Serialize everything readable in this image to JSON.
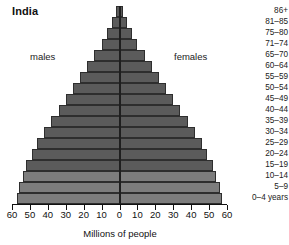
{
  "chart_data": {
    "type": "bar",
    "subtype": "population-pyramid",
    "title": "India",
    "xlabel": "Millions of people",
    "ylabel": "",
    "xlim": [
      -60,
      60
    ],
    "xticks": [
      60,
      50,
      40,
      30,
      20,
      10,
      0,
      10,
      20,
      30,
      40,
      50,
      60
    ],
    "grid": false,
    "legend_position": "inside-plot",
    "categories": [
      "86+",
      "81–85",
      "75–80",
      "71–74",
      "65–70",
      "60–64",
      "55–59",
      "50–54",
      "45–49",
      "40–44",
      "35–39",
      "30–34",
      "25–29",
      "20–24",
      "15–19",
      "10–14",
      "5–9",
      "0–4 years"
    ],
    "series": [
      {
        "name": "males",
        "side": "left",
        "values": [
          2,
          4,
          7,
          10,
          14,
          18,
          22,
          26,
          30,
          34,
          38,
          42,
          46,
          49,
          52,
          54,
          56,
          57
        ]
      },
      {
        "name": "females",
        "side": "right",
        "values": [
          2,
          4,
          7,
          10,
          14,
          18,
          22,
          26,
          30,
          34,
          38,
          42,
          46,
          49,
          52,
          54,
          56,
          57
        ]
      }
    ],
    "annotations": [
      {
        "text": "males",
        "position": "left-upper"
      },
      {
        "text": "females",
        "position": "right-upper"
      }
    ],
    "colors": {
      "bar_fill": "#5b5b5b",
      "bar_fill_light": "#7d7d7d",
      "bar_stroke": "#2e2e2e",
      "axis": "#111111",
      "text": "#1a1a1a",
      "background": "#ffffff"
    },
    "light_rows_from_bottom": 3
  }
}
